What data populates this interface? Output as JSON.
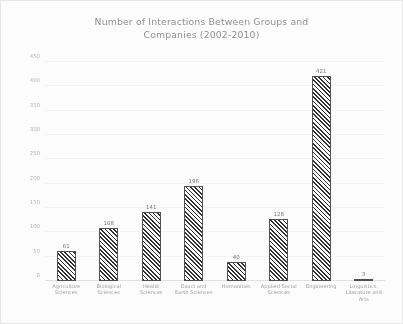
{
  "chart_data": {
    "type": "bar",
    "title": "Number of Interactions Between Groups and\nCompanies (2002-2010)",
    "xlabel": "",
    "ylabel": "",
    "ylim": [
      0,
      450
    ],
    "yticks": [
      0,
      50,
      100,
      150,
      200,
      250,
      300,
      350,
      400,
      450
    ],
    "grid": true,
    "legend": null,
    "categories": [
      "Agriculture Sciences",
      "Biological Sciences",
      "Health Sciences",
      "Exact and Earth Sciences",
      "Humanities",
      "Applied Social Sciences",
      "Engineering",
      "Linguistics, Literature and Arts"
    ],
    "values": [
      61,
      108,
      141,
      196,
      40,
      128,
      421,
      3
    ],
    "value_labels": [
      "61",
      "108",
      "141",
      "196",
      "40",
      "128",
      "421",
      "3"
    ],
    "bar_style": "diagonal-hatch",
    "bar_edge_color": "#4a4a4a",
    "bar_fill_color": "#ffffff",
    "text_color": "#8d8d8d"
  }
}
